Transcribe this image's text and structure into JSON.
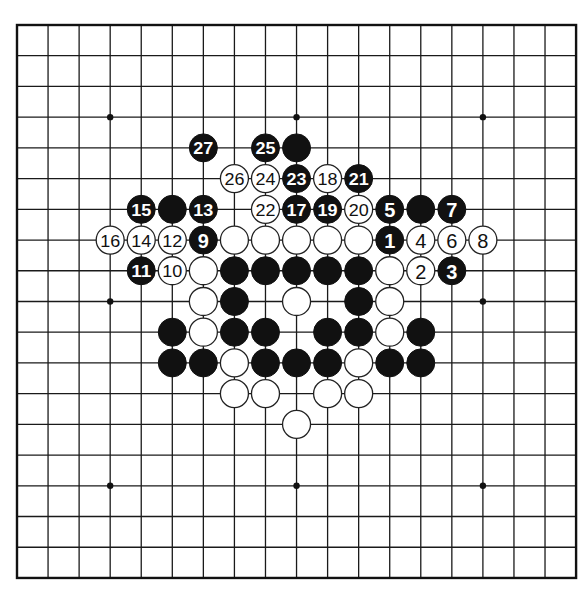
{
  "board": {
    "size": 19,
    "origin_x": 17,
    "origin_y": 25,
    "spacing_x": 31.06,
    "spacing_y": 30.72,
    "stone_radius": 14,
    "colors": {
      "line": "#1a1a1a",
      "black": "#111111",
      "white": "#ffffff",
      "background": "#ffffff"
    },
    "star_points": [
      [
        3,
        3
      ],
      [
        9,
        3
      ],
      [
        15,
        3
      ],
      [
        3,
        9
      ],
      [
        9,
        9
      ],
      [
        15,
        9
      ],
      [
        3,
        15
      ],
      [
        9,
        15
      ],
      [
        15,
        15
      ]
    ]
  },
  "stones": [
    {
      "col": 6,
      "row": 4,
      "color": "black",
      "label": "27"
    },
    {
      "col": 8,
      "row": 4,
      "color": "black",
      "label": "25"
    },
    {
      "col": 9,
      "row": 4,
      "color": "black",
      "label": ""
    },
    {
      "col": 7,
      "row": 5,
      "color": "white",
      "label": "26"
    },
    {
      "col": 8,
      "row": 5,
      "color": "white",
      "label": "24"
    },
    {
      "col": 9,
      "row": 5,
      "color": "black",
      "label": "23"
    },
    {
      "col": 10,
      "row": 5,
      "color": "white",
      "label": "18"
    },
    {
      "col": 11,
      "row": 5,
      "color": "black",
      "label": "21"
    },
    {
      "col": 4,
      "row": 6,
      "color": "black",
      "label": "15"
    },
    {
      "col": 5,
      "row": 6,
      "color": "black",
      "label": ""
    },
    {
      "col": 6,
      "row": 6,
      "color": "black",
      "label": "13"
    },
    {
      "col": 8,
      "row": 6,
      "color": "white",
      "label": "22"
    },
    {
      "col": 9,
      "row": 6,
      "color": "black",
      "label": "17"
    },
    {
      "col": 10,
      "row": 6,
      "color": "black",
      "label": "19"
    },
    {
      "col": 11,
      "row": 6,
      "color": "white",
      "label": "20"
    },
    {
      "col": 12,
      "row": 6,
      "color": "black",
      "label": "5"
    },
    {
      "col": 13,
      "row": 6,
      "color": "black",
      "label": ""
    },
    {
      "col": 14,
      "row": 6,
      "color": "black",
      "label": "7"
    },
    {
      "col": 3,
      "row": 7,
      "color": "white",
      "label": "16"
    },
    {
      "col": 4,
      "row": 7,
      "color": "white",
      "label": "14"
    },
    {
      "col": 5,
      "row": 7,
      "color": "white",
      "label": "12"
    },
    {
      "col": 6,
      "row": 7,
      "color": "black",
      "label": "9"
    },
    {
      "col": 7,
      "row": 7,
      "color": "white",
      "label": ""
    },
    {
      "col": 8,
      "row": 7,
      "color": "white",
      "label": ""
    },
    {
      "col": 9,
      "row": 7,
      "color": "white",
      "label": ""
    },
    {
      "col": 10,
      "row": 7,
      "color": "white",
      "label": ""
    },
    {
      "col": 11,
      "row": 7,
      "color": "white",
      "label": ""
    },
    {
      "col": 12,
      "row": 7,
      "color": "black",
      "label": "1"
    },
    {
      "col": 13,
      "row": 7,
      "color": "white",
      "label": "4"
    },
    {
      "col": 14,
      "row": 7,
      "color": "white",
      "label": "6"
    },
    {
      "col": 15,
      "row": 7,
      "color": "white",
      "label": "8"
    },
    {
      "col": 4,
      "row": 8,
      "color": "black",
      "label": "11"
    },
    {
      "col": 5,
      "row": 8,
      "color": "white",
      "label": "10"
    },
    {
      "col": 6,
      "row": 8,
      "color": "white",
      "label": ""
    },
    {
      "col": 7,
      "row": 8,
      "color": "black",
      "label": ""
    },
    {
      "col": 8,
      "row": 8,
      "color": "black",
      "label": ""
    },
    {
      "col": 9,
      "row": 8,
      "color": "black",
      "label": ""
    },
    {
      "col": 10,
      "row": 8,
      "color": "black",
      "label": ""
    },
    {
      "col": 11,
      "row": 8,
      "color": "black",
      "label": ""
    },
    {
      "col": 12,
      "row": 8,
      "color": "white",
      "label": ""
    },
    {
      "col": 13,
      "row": 8,
      "color": "white",
      "label": "2"
    },
    {
      "col": 14,
      "row": 8,
      "color": "black",
      "label": "3"
    },
    {
      "col": 6,
      "row": 9,
      "color": "white",
      "label": ""
    },
    {
      "col": 7,
      "row": 9,
      "color": "black",
      "label": ""
    },
    {
      "col": 9,
      "row": 9,
      "color": "white",
      "label": ""
    },
    {
      "col": 11,
      "row": 9,
      "color": "black",
      "label": ""
    },
    {
      "col": 12,
      "row": 9,
      "color": "white",
      "label": ""
    },
    {
      "col": 5,
      "row": 10,
      "color": "black",
      "label": ""
    },
    {
      "col": 6,
      "row": 10,
      "color": "white",
      "label": ""
    },
    {
      "col": 7,
      "row": 10,
      "color": "black",
      "label": ""
    },
    {
      "col": 8,
      "row": 10,
      "color": "black",
      "label": ""
    },
    {
      "col": 10,
      "row": 10,
      "color": "black",
      "label": ""
    },
    {
      "col": 11,
      "row": 10,
      "color": "black",
      "label": ""
    },
    {
      "col": 12,
      "row": 10,
      "color": "white",
      "label": ""
    },
    {
      "col": 13,
      "row": 10,
      "color": "black",
      "label": ""
    },
    {
      "col": 5,
      "row": 11,
      "color": "black",
      "label": ""
    },
    {
      "col": 6,
      "row": 11,
      "color": "black",
      "label": ""
    },
    {
      "col": 7,
      "row": 11,
      "color": "white",
      "label": ""
    },
    {
      "col": 8,
      "row": 11,
      "color": "black",
      "label": ""
    },
    {
      "col": 9,
      "row": 11,
      "color": "black",
      "label": ""
    },
    {
      "col": 10,
      "row": 11,
      "color": "black",
      "label": ""
    },
    {
      "col": 11,
      "row": 11,
      "color": "white",
      "label": ""
    },
    {
      "col": 12,
      "row": 11,
      "color": "black",
      "label": ""
    },
    {
      "col": 13,
      "row": 11,
      "color": "black",
      "label": ""
    },
    {
      "col": 7,
      "row": 12,
      "color": "white",
      "label": ""
    },
    {
      "col": 8,
      "row": 12,
      "color": "white",
      "label": ""
    },
    {
      "col": 10,
      "row": 12,
      "color": "white",
      "label": ""
    },
    {
      "col": 11,
      "row": 12,
      "color": "white",
      "label": ""
    },
    {
      "col": 9,
      "row": 13,
      "color": "white",
      "label": ""
    }
  ]
}
